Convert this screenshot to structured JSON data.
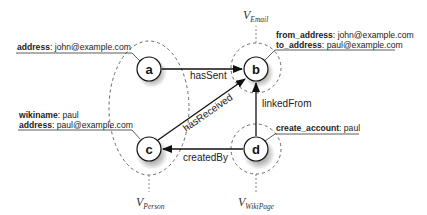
{
  "diagram": {
    "type": "property-graph",
    "nodes": [
      {
        "id": "a",
        "label": "a"
      },
      {
        "id": "b",
        "label": "b"
      },
      {
        "id": "c",
        "label": "c"
      },
      {
        "id": "d",
        "label": "d"
      }
    ],
    "edges": [
      {
        "from": "a",
        "to": "b",
        "label": "hasSent"
      },
      {
        "from": "c",
        "to": "b",
        "label": "hasReceived"
      },
      {
        "from": "d",
        "to": "b",
        "label": "linkedFrom"
      },
      {
        "from": "d",
        "to": "c",
        "label": "createdBy"
      }
    ],
    "groups": [
      {
        "name": "V",
        "subscript": "Person",
        "members": [
          "a",
          "c"
        ]
      },
      {
        "name": "V",
        "subscript": "Email",
        "members": [
          "b"
        ]
      },
      {
        "name": "V",
        "subscript": "WikiPage",
        "members": [
          "d"
        ]
      }
    ],
    "attributes": {
      "a": [
        {
          "key": "address",
          "value": "john@example.com"
        }
      ],
      "b": [
        {
          "key": "from_address",
          "value": "john@example.com"
        },
        {
          "key": "to_address",
          "value": "paul@example.com"
        }
      ],
      "c": [
        {
          "key": "wikiname",
          "value": "paul"
        },
        {
          "key": "address",
          "value": "paul@example.com"
        }
      ],
      "d": [
        {
          "key": "create_account",
          "value": "paul"
        }
      ]
    }
  }
}
